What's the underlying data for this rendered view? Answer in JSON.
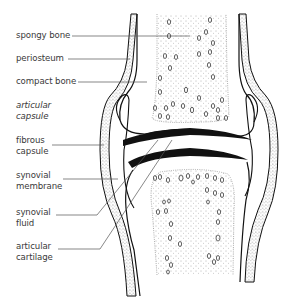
{
  "diagram": {
    "labels": [
      {
        "id": "spongy-bone",
        "lines": [
          "spongy bone"
        ],
        "italic": false
      },
      {
        "id": "periosteum",
        "lines": [
          "periosteum"
        ],
        "italic": false
      },
      {
        "id": "compact-bone",
        "lines": [
          "compact bone"
        ],
        "italic": false
      },
      {
        "id": "articular-capsule",
        "lines": [
          "articular",
          "capsule"
        ],
        "italic": true
      },
      {
        "id": "fibrous-capsule",
        "lines": [
          "fibrous",
          "capsule"
        ],
        "italic": false
      },
      {
        "id": "synovial-membrane",
        "lines": [
          "synovial",
          "membrane"
        ],
        "italic": false
      },
      {
        "id": "synovial-fluid",
        "lines": [
          "synovial",
          "fluid"
        ],
        "italic": false
      },
      {
        "id": "articular-cartilage",
        "lines": [
          "articular",
          "cartilage"
        ],
        "italic": false
      }
    ],
    "colors": {
      "ink": "#111111",
      "text": "#3a3a3a",
      "leader": "#555555",
      "background": "#ffffff"
    }
  }
}
